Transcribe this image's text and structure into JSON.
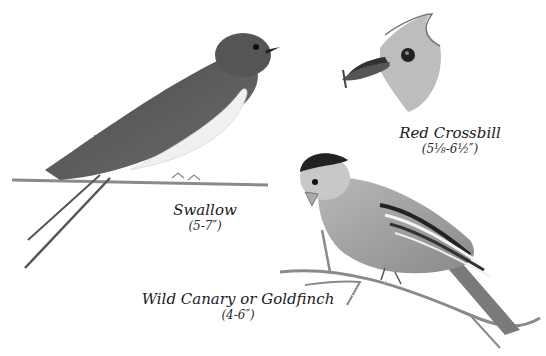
{
  "illustration": {
    "style": "pencil drawing, grayscale",
    "background": "#ffffff",
    "ink": "#2a2a2a"
  },
  "birds": [
    {
      "id": "swallow",
      "name": "Swallow",
      "size": "(5-7″)"
    },
    {
      "id": "red-crossbill",
      "name": "Red Crossbill",
      "size": "(5⅛-6½″)"
    },
    {
      "id": "goldfinch",
      "name": "Wild Canary or Goldfinch",
      "size": "(4-6″)"
    }
  ]
}
